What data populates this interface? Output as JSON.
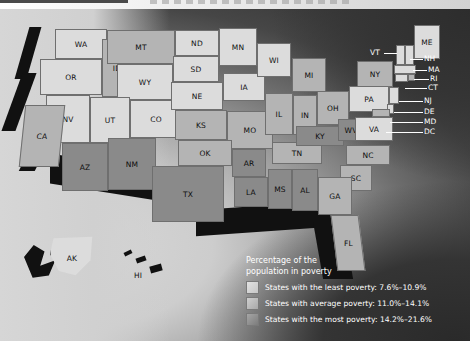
{
  "page": {
    "title_strip_present": true
  },
  "map": {
    "title": "Percentage of the population in poverty",
    "legend": {
      "heading_line1": "Percentage of the",
      "heading_line2": "population in poverty",
      "items": [
        {
          "swatch": "least-poverty-swatch",
          "label": "States with the least poverty: 7.6%–10.9%",
          "range_low": 7.6,
          "range_high": 10.9,
          "tier": 1
        },
        {
          "swatch": "average-poverty-swatch",
          "label": "States with average poverty: 11.0%–14.1%",
          "range_low": 11.0,
          "range_high": 14.1,
          "tier": 2
        },
        {
          "swatch": "most-poverty-swatch",
          "label": "States with the most poverty: 14.2%–21.6%",
          "range_low": 14.2,
          "range_high": 21.6,
          "tier": 3
        }
      ]
    },
    "colors": {
      "tier1": "#dcdcdc",
      "tier2": "#b4b4b4",
      "tier3": "#8a8a8a",
      "ocean": "#303030",
      "border": "#6f6f6f",
      "label_light": "#ffffff",
      "label_dark": "#111111"
    },
    "states": [
      {
        "code": "WA",
        "tier": 1
      },
      {
        "code": "OR",
        "tier": 1
      },
      {
        "code": "ID",
        "tier": 2
      },
      {
        "code": "MT",
        "tier": 2
      },
      {
        "code": "WY",
        "tier": 1
      },
      {
        "code": "ND",
        "tier": 1
      },
      {
        "code": "SD",
        "tier": 1
      },
      {
        "code": "MN",
        "tier": 1
      },
      {
        "code": "WI",
        "tier": 1
      },
      {
        "code": "NV",
        "tier": 1
      },
      {
        "code": "UT",
        "tier": 1
      },
      {
        "code": "CO",
        "tier": 1
      },
      {
        "code": "NE",
        "tier": 1
      },
      {
        "code": "IA",
        "tier": 1
      },
      {
        "code": "MI",
        "tier": 2
      },
      {
        "code": "CA",
        "tier": 2
      },
      {
        "code": "AZ",
        "tier": 3
      },
      {
        "code": "NM",
        "tier": 3
      },
      {
        "code": "KS",
        "tier": 2
      },
      {
        "code": "MO",
        "tier": 2
      },
      {
        "code": "IL",
        "tier": 2
      },
      {
        "code": "IN",
        "tier": 2
      },
      {
        "code": "OH",
        "tier": 2
      },
      {
        "code": "PA",
        "tier": 1
      },
      {
        "code": "NY",
        "tier": 2
      },
      {
        "code": "OK",
        "tier": 2
      },
      {
        "code": "AR",
        "tier": 3
      },
      {
        "code": "TN",
        "tier": 2
      },
      {
        "code": "KY",
        "tier": 3
      },
      {
        "code": "WV",
        "tier": 3
      },
      {
        "code": "VA",
        "tier": 1
      },
      {
        "code": "NC",
        "tier": 2
      },
      {
        "code": "SC",
        "tier": 2
      },
      {
        "code": "TX",
        "tier": 3
      },
      {
        "code": "LA",
        "tier": 3
      },
      {
        "code": "MS",
        "tier": 3
      },
      {
        "code": "AL",
        "tier": 3
      },
      {
        "code": "GA",
        "tier": 2
      },
      {
        "code": "FL",
        "tier": 2
      },
      {
        "code": "AK",
        "tier": 1
      },
      {
        "code": "HI",
        "tier": 1
      }
    ],
    "callout_labels": [
      {
        "code": "VT"
      },
      {
        "code": "ME"
      },
      {
        "code": "NH"
      },
      {
        "code": "MA"
      },
      {
        "code": "RI"
      },
      {
        "code": "CT"
      },
      {
        "code": "NJ"
      },
      {
        "code": "DE"
      },
      {
        "code": "MD"
      },
      {
        "code": "DC"
      }
    ],
    "insets": [
      {
        "code": "AK"
      },
      {
        "code": "HI"
      }
    ]
  }
}
